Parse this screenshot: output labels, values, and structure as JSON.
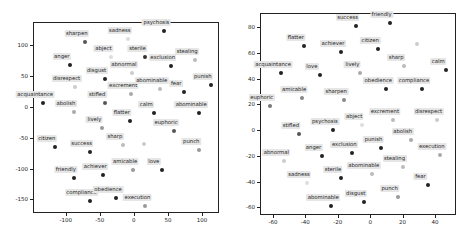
{
  "chart_data": [
    {
      "type": "scatter",
      "title": "",
      "xlabel": "",
      "ylabel": "",
      "xlim": [
        -148,
        125
      ],
      "ylim": [
        -172,
        138
      ],
      "xticks": [
        -100,
        -50,
        0,
        50,
        100
      ],
      "yticks": [
        100,
        50,
        0,
        -50,
        -100,
        -150
      ],
      "grid": false,
      "legend": null,
      "points": [
        {
          "label": "psychosis",
          "x": 45,
          "y": 123,
          "color": "#222222"
        },
        {
          "label": "sharpen",
          "x": -72,
          "y": 106,
          "color": "#555555"
        },
        {
          "label": "sadness",
          "x": -9,
          "y": 111,
          "color": "#dddddd"
        },
        {
          "label": "abject",
          "x": -33,
          "y": 81,
          "color": "#dddddd"
        },
        {
          "label": "sterile",
          "x": 17,
          "y": 82,
          "color": "#333333"
        },
        {
          "label": "exclusion",
          "x": 54,
          "y": 66,
          "color": "#222222"
        },
        {
          "label": "stealing",
          "x": 90,
          "y": 77,
          "color": "#bbbbbb"
        },
        {
          "label": "anger",
          "x": -94,
          "y": 69,
          "color": "#222222"
        },
        {
          "label": "disgust",
          "x": -43,
          "y": 45,
          "color": "#222222"
        },
        {
          "label": "abnormal",
          "x": -3,
          "y": 55,
          "color": "#cccccc"
        },
        {
          "label": "punish",
          "x": 113,
          "y": 35,
          "color": "#222222"
        },
        {
          "label": "disrespect",
          "x": -87,
          "y": 32,
          "color": "#cccccc"
        },
        {
          "label": "excrement",
          "x": -4,
          "y": 21,
          "color": "#aaaaaa"
        },
        {
          "label": "abominable",
          "x": 38,
          "y": 29,
          "color": "#bbbbbb"
        },
        {
          "label": "fear",
          "x": 74,
          "y": 24,
          "color": "#222222"
        },
        {
          "label": "acquaintance",
          "x": -133,
          "y": 6,
          "color": "#222222"
        },
        {
          "label": "abolish",
          "x": -88,
          "y": -8,
          "color": "#aaaaaa"
        },
        {
          "label": "stifled",
          "x": -42,
          "y": 6,
          "color": "#555555"
        },
        {
          "label": "calm",
          "x": 30,
          "y": -10,
          "color": "#222222"
        },
        {
          "label": "abominable",
          "x": 96,
          "y": -10,
          "color": "#222222"
        },
        {
          "label": "flatter",
          "x": -6,
          "y": -23,
          "color": "#222222"
        },
        {
          "label": "lively",
          "x": -46,
          "y": -34,
          "color": "#999999"
        },
        {
          "label": "euphoric",
          "x": 59,
          "y": -39,
          "color": "#555555"
        },
        {
          "label": "sharp",
          "x": -16,
          "y": -61,
          "color": "#bbbbbb"
        },
        {
          "label": "",
          "x": 15,
          "y": -60,
          "color": "#cccccc"
        },
        {
          "label": "citizen",
          "x": -116,
          "y": -65,
          "color": "#222222"
        },
        {
          "label": "success",
          "x": -65,
          "y": -73,
          "color": "#222222"
        },
        {
          "label": "punch",
          "x": 96,
          "y": -69,
          "color": "#999999"
        },
        {
          "label": "amicable",
          "x": -1,
          "y": -103,
          "color": "#999999"
        },
        {
          "label": "love",
          "x": 41,
          "y": -103,
          "color": "#222222"
        },
        {
          "label": "friendly",
          "x": -88,
          "y": -115,
          "color": "#222222"
        },
        {
          "label": "achiever",
          "x": -45,
          "y": -110,
          "color": "#222222"
        },
        {
          "label": "compliance",
          "x": -65,
          "y": -153,
          "color": "#222222"
        },
        {
          "label": "obedience",
          "x": -26,
          "y": -148,
          "color": "#222222"
        },
        {
          "label": "execution",
          "x": 17,
          "y": -160,
          "color": "#999999"
        }
      ]
    },
    {
      "type": "scatter",
      "title": "",
      "xlabel": "",
      "ylabel": "",
      "xlim": [
        -68,
        53
      ],
      "ylim": [
        -66,
        91
      ],
      "xticks": [
        -60,
        -40,
        -20,
        0,
        20,
        40
      ],
      "yticks": [
        80,
        60,
        40,
        20,
        0,
        -20,
        -40,
        -60
      ],
      "grid": false,
      "legend": null,
      "points": [
        {
          "label": "success",
          "x": -9,
          "y": 81,
          "color": "#222222"
        },
        {
          "label": "friendly",
          "x": 12,
          "y": 83,
          "color": "#222222"
        },
        {
          "label": "flatter",
          "x": -41,
          "y": 65,
          "color": "#222222"
        },
        {
          "label": "achiever",
          "x": -18,
          "y": 61,
          "color": "#222222"
        },
        {
          "label": "citizen",
          "x": 5,
          "y": 63,
          "color": "#222222"
        },
        {
          "label": "",
          "x": 29,
          "y": 67,
          "color": "#cccccc"
        },
        {
          "label": "acquaintance",
          "x": -55,
          "y": 44,
          "color": "#222222"
        },
        {
          "label": "love",
          "x": -31,
          "y": 43,
          "color": "#222222"
        },
        {
          "label": "lively",
          "x": -6,
          "y": 44,
          "color": "#aaaaaa"
        },
        {
          "label": "sharp",
          "x": 21,
          "y": 50,
          "color": "#bbbbbb"
        },
        {
          "label": "calm",
          "x": 47,
          "y": 47,
          "color": "#222222"
        },
        {
          "label": "obedience",
          "x": 10,
          "y": 32,
          "color": "#222222"
        },
        {
          "label": "compliance",
          "x": 32,
          "y": 32,
          "color": "#222222"
        },
        {
          "label": "amicable",
          "x": -42,
          "y": 25,
          "color": "#888888"
        },
        {
          "label": "sharpen",
          "x": -16,
          "y": 23,
          "color": "#888888"
        },
        {
          "label": "euphoric",
          "x": -62,
          "y": 19,
          "color": "#777777"
        },
        {
          "label": "excrement",
          "x": 14,
          "y": 8,
          "color": "#bbbbbb"
        },
        {
          "label": "disrespect",
          "x": 41,
          "y": 8,
          "color": "#cccccc"
        },
        {
          "label": "abject",
          "x": -5,
          "y": 4,
          "color": "#dddddd"
        },
        {
          "label": "stifled",
          "x": -44,
          "y": -3,
          "color": "#555555"
        },
        {
          "label": "psychosis",
          "x": -23,
          "y": 0,
          "color": "#222222"
        },
        {
          "label": "abolish",
          "x": 25,
          "y": -8,
          "color": "#aaaaaa"
        },
        {
          "label": "anger",
          "x": -30,
          "y": -20,
          "color": "#222222"
        },
        {
          "label": "exclusion",
          "x": -11,
          "y": -18,
          "color": "#222222"
        },
        {
          "label": "punish",
          "x": 7,
          "y": -14,
          "color": "#222222"
        },
        {
          "label": "execution",
          "x": 43,
          "y": -19,
          "color": "#aaaaaa"
        },
        {
          "label": "abnormal",
          "x": -53,
          "y": -24,
          "color": "#cccccc"
        },
        {
          "label": "stealing",
          "x": 20,
          "y": -29,
          "color": "#bbbbbb"
        },
        {
          "label": "abominable",
          "x": 1,
          "y": -34,
          "color": "#bbbbbb"
        },
        {
          "label": "sterile",
          "x": -18,
          "y": -37,
          "color": "#222222"
        },
        {
          "label": "sadness",
          "x": -39,
          "y": -41,
          "color": "#dddddd"
        },
        {
          "label": "fear",
          "x": 36,
          "y": -43,
          "color": "#222222"
        },
        {
          "label": "punch",
          "x": 17,
          "y": -52,
          "color": "#999999"
        },
        {
          "label": "disgust",
          "x": -4,
          "y": -56,
          "color": "#222222"
        },
        {
          "label": "abominable",
          "x": -24,
          "y": -59,
          "color": "#222222"
        }
      ]
    }
  ],
  "plots": [
    {
      "frame": {
        "left": 33,
        "top": 22,
        "width": 186,
        "height": 191
      }
    },
    {
      "frame": {
        "left": 260,
        "top": 13,
        "width": 196,
        "height": 202
      }
    }
  ]
}
